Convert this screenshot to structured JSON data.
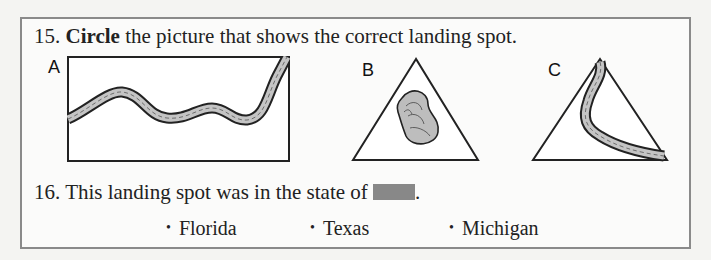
{
  "questions": [
    {
      "number": "15.",
      "bold_word": "Circle",
      "text": " the picture that shows the correct landing spot.",
      "pictures": [
        {
          "label": "A",
          "shape": "rectangle",
          "content": "winding-river"
        },
        {
          "label": "B",
          "shape": "triangle",
          "content": "lake"
        },
        {
          "label": "C",
          "shape": "triangle",
          "content": "river"
        }
      ]
    },
    {
      "number": "16.",
      "text_before": "This landing spot was in the state of ",
      "blank": "redacted-answer-box",
      "text_after": ".",
      "options": [
        "Florida",
        "Texas",
        "Michigan"
      ],
      "bullet": "•"
    }
  ],
  "colors": {
    "river_fill": "#bdbdbd",
    "blank_fill": "#888888",
    "frame": "#8a8a8a"
  }
}
